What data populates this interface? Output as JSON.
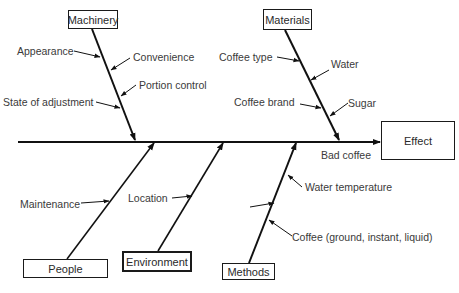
{
  "diagram": {
    "type": "fishbone",
    "effect": {
      "label": "Effect",
      "problem": "Bad coffee"
    },
    "categories": [
      {
        "name": "Machinery",
        "causes": [
          "Appearance",
          "Convenience",
          "Portion control",
          "State of adjustment"
        ]
      },
      {
        "name": "Materials",
        "causes": [
          "Coffee type",
          "Water",
          "Coffee brand",
          "Sugar"
        ]
      },
      {
        "name": "People",
        "causes": [
          "Maintenance"
        ]
      },
      {
        "name": "Environment",
        "causes": [
          "Location"
        ]
      },
      {
        "name": "Methods",
        "causes": [
          "Water temperature",
          "",
          "Coffee (ground, instant, liquid)"
        ]
      }
    ]
  }
}
